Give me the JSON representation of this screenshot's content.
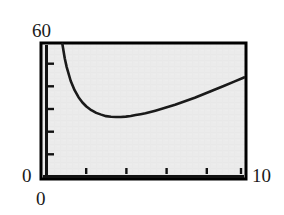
{
  "figure": {
    "background_color": "#ffffff",
    "plot_area_color": "#ebebeb",
    "axis_color": "#000000",
    "curve_color": "#1a1a1a"
  },
  "labels": {
    "y_max": "60",
    "y_zero": "0",
    "x_zero": "0",
    "x_max": "10"
  },
  "chart_data": {
    "type": "line",
    "title": "",
    "xlabel": "",
    "ylabel": "",
    "xlim": [
      0,
      10
    ],
    "ylim": [
      0,
      60
    ],
    "grid": false,
    "legend": "none",
    "x_tick_labels": [
      "0",
      "10"
    ],
    "y_tick_labels": [
      "0",
      "60"
    ],
    "x_ticks_major": [
      0,
      10
    ],
    "x_ticks_minor": [
      2,
      4,
      6,
      8
    ],
    "y_ticks_minor": [
      10,
      20,
      30,
      40,
      50
    ],
    "series": [
      {
        "name": "curve",
        "x": [
          0.78,
          0.9,
          1.0,
          1.2,
          1.4,
          1.6,
          1.8,
          2.0,
          2.25,
          2.5,
          2.75,
          3.0,
          3.25,
          3.5,
          3.75,
          4.0,
          4.25,
          4.5,
          4.75,
          5.0,
          5.5,
          6.0,
          6.5,
          7.0,
          7.5,
          8.0,
          8.5,
          9.0,
          9.5,
          10.0
        ],
        "y": [
          60.0,
          53.5,
          49.5,
          43.3,
          39.0,
          35.8,
          33.4,
          31.6,
          29.9,
          28.7,
          27.9,
          27.2,
          26.9,
          26.8,
          26.8,
          27.0,
          27.3,
          27.7,
          28.1,
          28.5,
          29.7,
          31.0,
          32.4,
          34.0,
          35.6,
          37.4,
          39.2,
          41.0,
          42.9,
          44.8
        ]
      }
    ]
  }
}
